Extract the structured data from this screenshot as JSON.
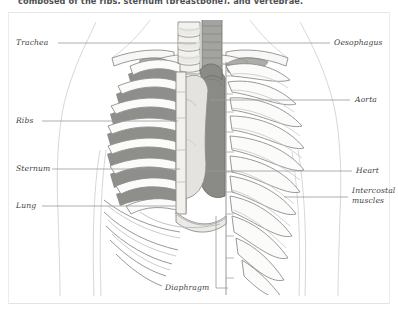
{
  "document": {
    "body_text": "composed of the ribs, sternum (breastbone), and vertebrae."
  },
  "figure": {
    "labels": {
      "trachea": "Trachea",
      "ribs": "Ribs",
      "sternum": "Sternum",
      "lung": "Lung",
      "oesophagus": "Oesophagus",
      "aorta": "Aorta",
      "heart": "Heart",
      "intercostal_line1": "Intercostal",
      "intercostal_line2": "muscles",
      "diaphragm": "Diaphragm"
    }
  },
  "colors": {
    "page_background": "#ffffff",
    "ink": "#3f3f44",
    "leader_line": "#9a9a9a",
    "outline": "#8d8d8d",
    "bone_light": "#fbfbfa",
    "bone_shade": "#eceae6",
    "intercostal_dark": "#8e8e8a",
    "lung_dark": "#8a8a86",
    "heart_pale": "#e4e3df",
    "skin_outline": "#cfcfcf"
  }
}
